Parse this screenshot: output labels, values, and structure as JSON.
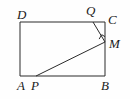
{
  "figure": {
    "kind": "geometry-diagram",
    "stroke_color": "#2b2b2b",
    "background_color": "#fefefe",
    "label_color": "#1a1a1a"
  },
  "rectangle": {
    "name": "ABCD",
    "corners": {
      "A": {
        "label": "A",
        "x": 20,
        "y": 76
      },
      "B": {
        "label": "B",
        "x": 105,
        "y": 76
      },
      "C": {
        "label": "C",
        "x": 105,
        "y": 22
      },
      "D": {
        "label": "D",
        "x": 20,
        "y": 22
      }
    }
  },
  "points": {
    "P": {
      "label": "P",
      "x": 36,
      "y": 76,
      "on_side": "AB"
    },
    "Q": {
      "label": "Q",
      "x": 93,
      "y": 22,
      "on_side": "DC"
    },
    "M": {
      "label": "M",
      "x": 105,
      "y": 42,
      "on_side": "BC"
    }
  },
  "segments": [
    {
      "name": "QM",
      "from": "Q",
      "to": "M"
    },
    {
      "name": "PM",
      "from": "P",
      "to": "M"
    }
  ],
  "right_angle": {
    "at": "M",
    "marker": "square",
    "size": 6
  },
  "labels": [
    {
      "key": "D",
      "text": "D",
      "left": 17,
      "top": 8
    },
    {
      "key": "Q",
      "text": "Q",
      "left": 86,
      "top": 4
    },
    {
      "key": "C",
      "text": "C",
      "left": 108,
      "top": 13
    },
    {
      "key": "M",
      "text": "M",
      "left": 109,
      "top": 37
    },
    {
      "key": "A",
      "text": "A",
      "left": 17,
      "top": 79
    },
    {
      "key": "P",
      "text": "P",
      "left": 31,
      "top": 79
    },
    {
      "key": "B",
      "text": "B",
      "left": 101,
      "top": 79
    }
  ]
}
